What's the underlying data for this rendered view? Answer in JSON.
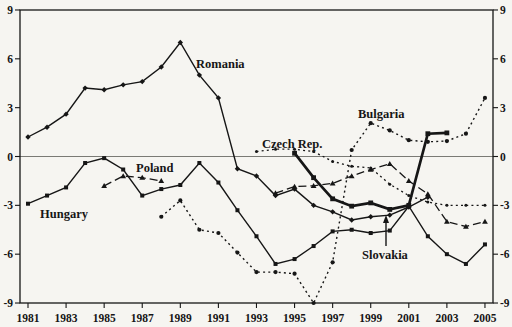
{
  "figure": {
    "background": "#f6f5f1",
    "ink": "#161616",
    "zero_line_color": "#5a5a55"
  },
  "chart_data": {
    "type": "line",
    "title": "",
    "xlabel": "",
    "ylabel": "",
    "x_range_years": [
      1981,
      2005
    ],
    "ylim": [
      -9,
      9
    ],
    "grid": "zero-line-only",
    "legend": "inline-labels",
    "x_tick_labels": [
      "1981",
      "1983",
      "1985",
      "1987",
      "1989",
      "1991",
      "1993",
      "1995",
      "1997",
      "1999",
      "2001",
      "2003",
      "2005"
    ],
    "y_tick_labels_left": [
      "9",
      "6",
      "3",
      "0",
      "-3",
      "-6",
      "-9"
    ],
    "y_tick_labels_right": [
      "9",
      "6",
      "3",
      "0",
      "-3",
      "-6",
      "-9"
    ],
    "y_tick_values": [
      9,
      6,
      3,
      0,
      -3,
      -6,
      -9
    ],
    "series": [
      {
        "name": "czech-rep",
        "label": "Czech Rep.",
        "line": "dotted",
        "width": 1.3,
        "marker": "dot-small",
        "label_px": [
          262,
          148
        ],
        "points": [
          [
            1993,
            0.3
          ],
          [
            1994,
            0.45
          ],
          [
            1995,
            0.45
          ],
          [
            1996,
            0.3
          ],
          [
            1997,
            -0.3
          ],
          [
            1998,
            -0.6
          ],
          [
            1999,
            -0.7
          ],
          [
            2000,
            -1.7
          ],
          [
            2001,
            -2.4
          ],
          [
            2002,
            -2.8
          ],
          [
            2003,
            -3.0
          ],
          [
            2004,
            -3.0
          ],
          [
            2005,
            -3.0
          ]
        ]
      },
      {
        "name": "bulgaria",
        "label": "Bulgaria",
        "line": "dotted",
        "width": 1.4,
        "marker": "dot",
        "label_px": [
          358,
          118
        ],
        "points": [
          [
            1988,
            -3.7
          ],
          [
            1989,
            -2.7
          ],
          [
            1990,
            -4.5
          ],
          [
            1991,
            -4.7
          ],
          [
            1992,
            -5.9
          ],
          [
            1993,
            -7.1
          ],
          [
            1994,
            -7.1
          ],
          [
            1995,
            -7.2
          ],
          [
            1996,
            -9.0
          ],
          [
            1997,
            -6.5
          ],
          [
            1998,
            0.4
          ],
          [
            1999,
            2.05
          ],
          [
            2000,
            1.6
          ],
          [
            2001,
            1.0
          ],
          [
            2002,
            0.9
          ],
          [
            2003,
            0.95
          ],
          [
            2004,
            1.4
          ],
          [
            2005,
            3.6
          ]
        ]
      },
      {
        "name": "poland",
        "label": "Poland",
        "line": "dashed",
        "width": 1.3,
        "marker": "triangle",
        "label_px": [
          136,
          172
        ],
        "points": [
          [
            1985,
            -1.8
          ],
          [
            1986,
            -1.2
          ],
          [
            1987,
            -1.3
          ],
          [
            1988,
            -1.5
          ],
          [
            1994,
            -2.25
          ],
          [
            1995,
            -1.85
          ],
          [
            1996,
            -1.8
          ],
          [
            1997,
            -1.65
          ],
          [
            1998,
            -1.2
          ],
          [
            1999,
            -0.8
          ],
          [
            2000,
            -0.45
          ],
          [
            2001,
            -1.5
          ],
          [
            2002,
            -2.3
          ],
          [
            2003,
            -4.0
          ],
          [
            2004,
            -4.3
          ],
          [
            2005,
            -4.0
          ]
        ]
      },
      {
        "name": "romania",
        "label": "Romania",
        "line": "solid",
        "width": 1.4,
        "marker": "diamond",
        "label_px": [
          196,
          68
        ],
        "points": [
          [
            1981,
            1.2
          ],
          [
            1982,
            1.8
          ],
          [
            1983,
            2.6
          ],
          [
            1984,
            4.2
          ],
          [
            1985,
            4.1
          ],
          [
            1986,
            4.4
          ],
          [
            1987,
            4.6
          ],
          [
            1988,
            5.5
          ],
          [
            1989,
            7.0
          ],
          [
            1990,
            5.0
          ],
          [
            1991,
            3.6
          ],
          [
            1992,
            -0.75
          ],
          [
            1993,
            -1.2
          ],
          [
            1994,
            -2.4
          ],
          [
            1995,
            -2.0
          ],
          [
            1996,
            -3.0
          ],
          [
            1997,
            -3.4
          ],
          [
            1998,
            -3.9
          ],
          [
            1999,
            -3.7
          ],
          [
            2000,
            -3.6
          ],
          [
            2001,
            -3.1
          ],
          [
            2002,
            -2.5
          ]
        ]
      },
      {
        "name": "hungary",
        "label": "Hungary",
        "line": "solid",
        "width": 1.4,
        "marker": "square",
        "label_px": [
          40,
          218
        ],
        "points": [
          [
            1981,
            -2.9
          ],
          [
            1982,
            -2.4
          ],
          [
            1983,
            -1.9
          ],
          [
            1984,
            -0.4
          ],
          [
            1985,
            -0.1
          ],
          [
            1986,
            -0.8
          ],
          [
            1987,
            -2.4
          ],
          [
            1988,
            -2.0
          ],
          [
            1989,
            -1.75
          ],
          [
            1990,
            -0.4
          ],
          [
            1991,
            -1.6
          ],
          [
            1992,
            -3.3
          ],
          [
            1993,
            -4.9
          ],
          [
            1994,
            -6.6
          ],
          [
            1995,
            -6.3
          ],
          [
            1996,
            -5.5
          ],
          [
            1997,
            -4.6
          ],
          [
            1998,
            -4.5
          ],
          [
            1999,
            -4.7
          ],
          [
            2000,
            -4.55
          ],
          [
            2001,
            -3.05
          ],
          [
            2002,
            -4.9
          ],
          [
            2003,
            -6.0
          ],
          [
            2004,
            -6.6
          ],
          [
            2005,
            -5.4
          ]
        ]
      },
      {
        "name": "slovakia",
        "label": "Slovakia",
        "line": "solid",
        "width": 2.7,
        "marker": "square-big",
        "label_px": [
          362,
          259
        ],
        "points": [
          [
            1995,
            0.2
          ],
          [
            1996,
            -1.3
          ],
          [
            1997,
            -2.6
          ],
          [
            1998,
            -3.05
          ],
          [
            1999,
            -2.85
          ],
          [
            2000,
            -3.25
          ],
          [
            2001,
            -3.0
          ],
          [
            2002,
            1.4
          ],
          [
            2003,
            1.45
          ]
        ]
      }
    ],
    "annotations": [
      {
        "type": "arrow",
        "for": "slovakia",
        "from_px": [
          386,
          246
        ],
        "to_px": [
          386,
          215
        ]
      }
    ]
  }
}
